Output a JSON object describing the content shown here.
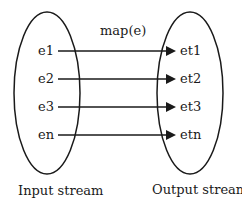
{
  "diagram": {
    "function_label": "map(e)",
    "input": {
      "label": "Input stream",
      "items": [
        "e1",
        "e2",
        "e3",
        "en"
      ]
    },
    "output": {
      "label": "Output stream",
      "items": [
        "et1",
        "et2",
        "et3",
        "etn"
      ]
    },
    "stroke_color": "#1a1a1a"
  }
}
